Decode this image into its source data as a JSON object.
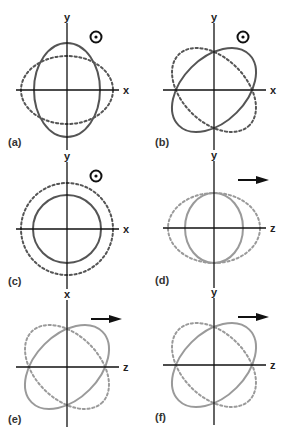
{
  "figure": {
    "colors": {
      "axis": "#111111",
      "dark_curve": "#555555",
      "light_curve": "#9a9a9a",
      "background": "#ffffff"
    },
    "panels": [
      {
        "id": "a",
        "label": "(a)",
        "cx": 67,
        "cy": 90,
        "vertical_axis_label": "y",
        "horizontal_axis_label": "x",
        "direction_symbol": "dot-in-circle",
        "curve_color": "dark_curve",
        "solid": {
          "rx": 33,
          "ry": 47,
          "rotate": 0
        },
        "dotted": {
          "rx": 46,
          "ry": 34,
          "rotate": 0
        }
      },
      {
        "id": "b",
        "label": "(b)",
        "cx": 214,
        "cy": 90,
        "vertical_axis_label": "y",
        "horizontal_axis_label": "x",
        "direction_symbol": "dot-in-circle",
        "curve_color": "dark_curve",
        "solid": {
          "rx": 50,
          "ry": 32,
          "rotate": -45
        },
        "dotted": {
          "rx": 50,
          "ry": 32,
          "rotate": 45
        }
      },
      {
        "id": "c",
        "label": "(c)",
        "cx": 67,
        "cy": 229,
        "vertical_axis_label": "y",
        "horizontal_axis_label": "x",
        "direction_symbol": "dot-in-circle",
        "curve_color": "dark_curve",
        "solid": {
          "rx": 34,
          "ry": 34,
          "rotate": 0
        },
        "dotted": {
          "rx": 46,
          "ry": 46,
          "rotate": 0
        }
      },
      {
        "id": "d",
        "label": "(d)",
        "cx": 214,
        "cy": 228,
        "vertical_axis_label": "y",
        "horizontal_axis_label": "z",
        "direction_symbol": "arrow-right",
        "curve_color": "light_curve",
        "solid": {
          "rx": 29,
          "ry": 35,
          "rotate": 0
        },
        "dotted": {
          "rx": 46,
          "ry": 35,
          "rotate": 0
        }
      },
      {
        "id": "e",
        "label": "(e)",
        "cx": 67,
        "cy": 367,
        "vertical_axis_label": "x",
        "horizontal_axis_label": "z",
        "direction_symbol": "arrow-right",
        "curve_color": "light_curve",
        "solid": {
          "rx": 50,
          "ry": 32,
          "rotate": -45
        },
        "dotted": {
          "rx": 50,
          "ry": 32,
          "rotate": 45
        }
      },
      {
        "id": "f",
        "label": "(f)",
        "cx": 214,
        "cy": 365,
        "vertical_axis_label": "y",
        "horizontal_axis_label": "z",
        "direction_symbol": "arrow-right",
        "curve_color": "light_curve",
        "solid": {
          "rx": 50,
          "ry": 32,
          "rotate": -45
        },
        "dotted": {
          "rx": 50,
          "ry": 32,
          "rotate": 45
        }
      }
    ]
  }
}
